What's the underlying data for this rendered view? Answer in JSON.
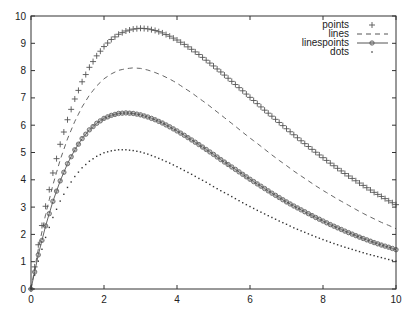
{
  "chart_data": {
    "type": "line",
    "title": "",
    "xlabel": "",
    "ylabel": "",
    "xlim": [
      0,
      10
    ],
    "ylim": [
      0,
      10
    ],
    "grid": false,
    "legend_position": "top-right",
    "x_ticks": [
      0,
      2,
      4,
      6,
      8,
      10
    ],
    "y_ticks": [
      0,
      1,
      2,
      3,
      4,
      5,
      6,
      7,
      8,
      9,
      10
    ],
    "x": [
      0,
      0.2,
      0.4,
      0.6,
      0.8,
      1,
      1.2,
      1.4,
      1.6,
      1.8,
      2,
      2.2,
      2.4,
      2.6,
      2.8,
      3,
      3.2,
      3.4,
      3.6,
      3.8,
      4,
      4.2,
      4.4,
      4.6,
      4.8,
      5,
      5.2,
      5.4,
      5.6,
      5.8,
      6,
      6.2,
      6.4,
      6.6,
      6.8,
      7,
      7.2,
      7.4,
      7.6,
      7.8,
      8,
      8.2,
      8.4,
      8.6,
      8.8,
      9,
      9.2,
      9.4,
      9.6,
      9.8,
      10
    ],
    "series": [
      {
        "name": "points",
        "style": "points",
        "marker": "+",
        "values": [
          0,
          1.62,
          3.03,
          4.25,
          5.3,
          6.2,
          6.96,
          7.59,
          8.12,
          8.54,
          8.88,
          9.14,
          9.33,
          9.45,
          9.52,
          9.55,
          9.53,
          9.47,
          9.38,
          9.26,
          9.12,
          8.96,
          8.78,
          8.59,
          8.38,
          8.17,
          7.95,
          7.72,
          7.49,
          7.26,
          7.02,
          6.79,
          6.55,
          6.33,
          6.1,
          5.87,
          5.65,
          5.43,
          5.22,
          5.01,
          4.81,
          4.61,
          4.42,
          4.23,
          4.05,
          3.88,
          3.71,
          3.54,
          3.39,
          3.23,
          3.09
        ]
      },
      {
        "name": "lines",
        "style": "dashed-line",
        "values": [
          0,
          1.46,
          2.73,
          3.81,
          4.73,
          5.5,
          6.14,
          6.67,
          7.1,
          7.44,
          7.7,
          7.88,
          8.01,
          8.07,
          8.1,
          8.08,
          8.02,
          7.93,
          7.82,
          7.69,
          7.54,
          7.36,
          7.19,
          6.99,
          6.8,
          6.59,
          6.38,
          6.17,
          5.96,
          5.74,
          5.53,
          5.33,
          5.12,
          4.91,
          4.71,
          4.52,
          4.32,
          4.14,
          3.96,
          3.78,
          3.61,
          3.45,
          3.29,
          3.14,
          2.99,
          2.84,
          2.7,
          2.57,
          2.44,
          2.33,
          2.21
        ]
      },
      {
        "name": "linespoints",
        "style": "line-with-markers",
        "marker": "diamond-circle",
        "values": [
          0,
          1.25,
          2.31,
          3.21,
          3.96,
          4.59,
          5.1,
          5.51,
          5.83,
          6.07,
          6.25,
          6.36,
          6.43,
          6.45,
          6.43,
          6.38,
          6.3,
          6.2,
          6.08,
          5.94,
          5.79,
          5.63,
          5.46,
          5.29,
          5.11,
          4.93,
          4.74,
          4.56,
          4.38,
          4.2,
          4.02,
          3.85,
          3.68,
          3.51,
          3.35,
          3.19,
          3.04,
          2.9,
          2.76,
          2.62,
          2.49,
          2.36,
          2.24,
          2.12,
          2.01,
          1.9,
          1.8,
          1.7,
          1.61,
          1.53,
          1.44
        ]
      },
      {
        "name": "dots",
        "style": "dots",
        "values": [
          0,
          1.02,
          1.89,
          2.62,
          3.22,
          3.72,
          4.12,
          4.44,
          4.68,
          4.86,
          4.99,
          5.06,
          5.1,
          5.1,
          5.07,
          5.02,
          4.94,
          4.84,
          4.73,
          4.61,
          4.48,
          4.34,
          4.2,
          4.05,
          3.91,
          3.75,
          3.6,
          3.46,
          3.31,
          3.16,
          3.02,
          2.88,
          2.75,
          2.62,
          2.49,
          2.37,
          2.24,
          2.13,
          2.02,
          1.91,
          1.81,
          1.71,
          1.62,
          1.53,
          1.45,
          1.37,
          1.29,
          1.22,
          1.15,
          1.08,
          1.02
        ]
      }
    ]
  },
  "legend": {
    "items": [
      {
        "label": "points"
      },
      {
        "label": "lines"
      },
      {
        "label": "linespoints"
      },
      {
        "label": "dots"
      }
    ]
  },
  "colors": {
    "axis": "#333333",
    "series": "#555555",
    "background": "#ffffff"
  }
}
